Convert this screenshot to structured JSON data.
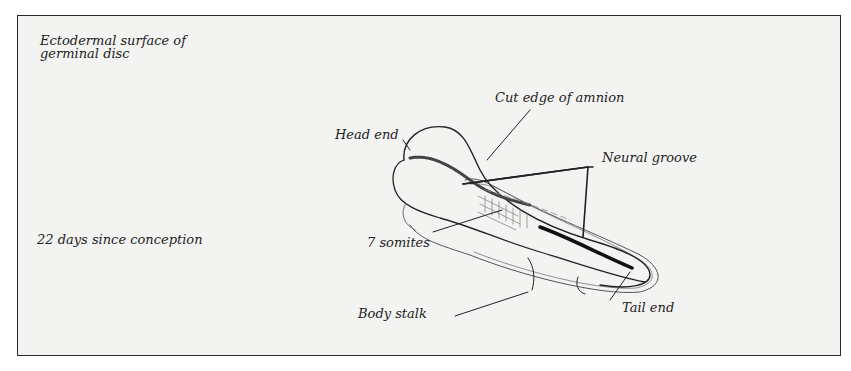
{
  "figure": {
    "caption_top": [
      "Ectodermal surface of",
      "germinal disc"
    ],
    "caption_side": "22 days since conception",
    "labels": {
      "head_end": "Head end",
      "cut_edge_amnion": "Cut edge of amnion",
      "neural_groove": "Neural groove",
      "somites": "7 somites",
      "body_stalk": "Body stalk",
      "tail_end": "Tail end"
    },
    "colors": {
      "background": "#f3f3f1",
      "ink": "#222222",
      "border": "#2a2a2a"
    }
  }
}
